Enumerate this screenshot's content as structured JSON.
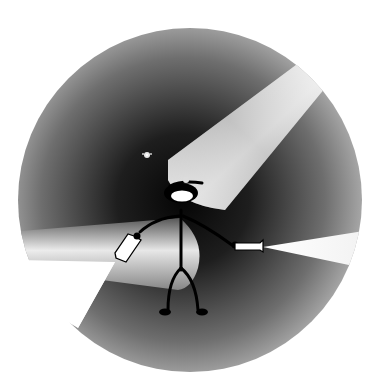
{
  "illustration": {
    "subject": "stick figure with headlamp holding two flashlights in the dark",
    "colors": {
      "background": "#ffffff",
      "darkness_center": "#0a0a0a",
      "darkness_edge": "#9a9a9a",
      "beam_light": "#f4f4f4",
      "figure": "#000000",
      "lamp_glow": "#ffffff"
    },
    "elements": {
      "circle": {
        "cx": 190,
        "cy": 200,
        "r": 172
      },
      "head_beam": "upper-right cone from headlamp",
      "left_flashlight": "held in left hand, beam to lower-left",
      "right_flashlight": "held in right hand, beam to right",
      "eyes_in_dark": "small glowing eyes upper-left of head"
    }
  }
}
